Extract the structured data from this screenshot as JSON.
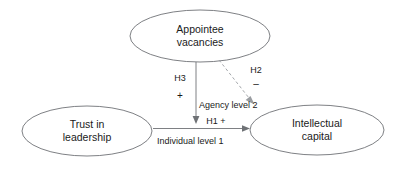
{
  "diagram": {
    "type": "path-model",
    "background_color": "#ffffff",
    "stroke_color": "#6f7276",
    "dashed_stroke_color": "#9a9da1",
    "text_color": "#1a1a1a",
    "nodes": [
      {
        "id": "appointee-vacancies",
        "line1": "Appointee",
        "line2": "vacancies",
        "shape": "ellipse",
        "cx": 200,
        "cy": 36,
        "rx": 70,
        "ry": 26
      },
      {
        "id": "trust-in-leadership",
        "line1": "Trust in",
        "line2": "leadership",
        "shape": "ellipse",
        "cx": 87,
        "cy": 131,
        "rx": 65,
        "ry": 25
      },
      {
        "id": "intellectual-capital",
        "line1": "Intellectual",
        "line2": "capital",
        "shape": "ellipse",
        "cx": 317,
        "cy": 130,
        "rx": 67,
        "ry": 25
      }
    ],
    "edges": [
      {
        "id": "h1",
        "from": "trust-in-leadership",
        "to": "intellectual-capital",
        "style": "solid",
        "hypothesis": "H1",
        "sign": "+",
        "label": "H1 +"
      },
      {
        "id": "h3",
        "from": "appointee-vacancies",
        "to": "h1-path",
        "style": "solid",
        "hypothesis": "H3",
        "sign": "+"
      },
      {
        "id": "h2",
        "from": "appointee-vacancies",
        "to": "intellectual-capital",
        "style": "dashed",
        "hypothesis": "H2",
        "sign": "–"
      }
    ],
    "level_labels": [
      {
        "id": "agency-level",
        "text": "Agency level 2"
      },
      {
        "id": "individual-level",
        "text": "Individual level 1"
      }
    ]
  }
}
